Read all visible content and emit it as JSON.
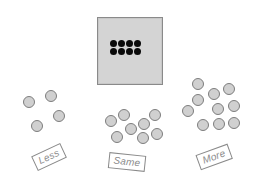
{
  "target": {
    "square_color": "#d4d4d4",
    "dot_color": "#0a0a0a",
    "dot_count": 8,
    "dots": [
      {
        "x": 113,
        "y": 43
      },
      {
        "x": 121,
        "y": 43
      },
      {
        "x": 129,
        "y": 43
      },
      {
        "x": 137,
        "y": 43
      },
      {
        "x": 113,
        "y": 51
      },
      {
        "x": 121,
        "y": 51
      },
      {
        "x": 129,
        "y": 51
      },
      {
        "x": 137,
        "y": 51
      }
    ]
  },
  "groups": [
    {
      "id": "less",
      "label": "Less",
      "count": 4,
      "label_pos": {
        "x": 49,
        "y": 157,
        "rot": "-25deg"
      },
      "balls": [
        {
          "x": 29,
          "y": 102
        },
        {
          "x": 51,
          "y": 96
        },
        {
          "x": 59,
          "y": 116
        },
        {
          "x": 37,
          "y": 126
        }
      ]
    },
    {
      "id": "same",
      "label": "Same",
      "count": 8,
      "label_pos": {
        "x": 127,
        "y": 162,
        "rot": "6deg"
      },
      "balls": [
        {
          "x": 111,
          "y": 121
        },
        {
          "x": 124,
          "y": 115
        },
        {
          "x": 117,
          "y": 137
        },
        {
          "x": 131,
          "y": 129
        },
        {
          "x": 144,
          "y": 124
        },
        {
          "x": 155,
          "y": 115
        },
        {
          "x": 143,
          "y": 138
        },
        {
          "x": 157,
          "y": 134
        }
      ]
    },
    {
      "id": "more",
      "label": "More",
      "count": 10,
      "label_pos": {
        "x": 214,
        "y": 157,
        "rot": "-20deg"
      },
      "balls": [
        {
          "x": 198,
          "y": 84
        },
        {
          "x": 198,
          "y": 100
        },
        {
          "x": 214,
          "y": 94
        },
        {
          "x": 229,
          "y": 89
        },
        {
          "x": 188,
          "y": 111
        },
        {
          "x": 218,
          "y": 109
        },
        {
          "x": 234,
          "y": 106
        },
        {
          "x": 203,
          "y": 125
        },
        {
          "x": 219,
          "y": 124
        },
        {
          "x": 234,
          "y": 123
        }
      ]
    }
  ],
  "ball_color": "#d0d0d0",
  "ball_border": "#7d7d7d"
}
